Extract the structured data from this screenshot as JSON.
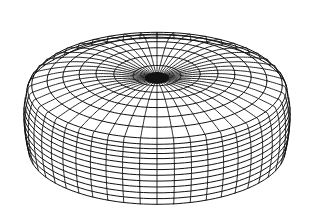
{
  "figure": {
    "background": "#ffffff",
    "line_color": "#111111",
    "center_x": 157,
    "center_y": 78,
    "outer_radius_x": 137,
    "outer_radius_y": 58,
    "side_height": 72,
    "radial_lines": 48,
    "top_rings": 7,
    "side_rings": 12,
    "center_blob": {
      "rx": 12,
      "ry": 6
    }
  }
}
